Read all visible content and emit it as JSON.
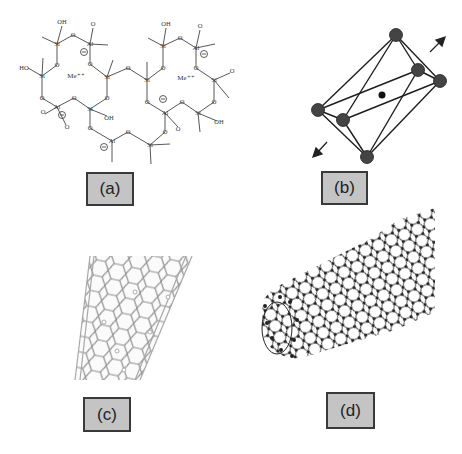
{
  "figure": {
    "panels": [
      {
        "id": "a",
        "label": "(a)",
        "description": "Aluminosilicate (geopolymer/zeolite-like) framework structure",
        "atoms": {
          "si": "Si",
          "al": "Al",
          "o": "O",
          "oh": "OH",
          "ho": "HO",
          "cation": "Me⁺⁺",
          "negative_charge": "⊖"
        }
      },
      {
        "id": "b",
        "label": "(b)",
        "description": "Octahedral coordination with central atom and strain arrows"
      },
      {
        "id": "c",
        "label": "(c)",
        "description": "Single-walled carbon nanotube (light line rendering)"
      },
      {
        "id": "d",
        "label": "(d)",
        "description": "Carbon nanotube ball-and-stick model"
      }
    ],
    "colors": {
      "label_box_fill": "#c4c4c4",
      "label_box_border": "#3a3a3a",
      "atom_dark": "#3c3c3c",
      "line": "#222222",
      "light_tube": "#9a9a9a"
    }
  }
}
